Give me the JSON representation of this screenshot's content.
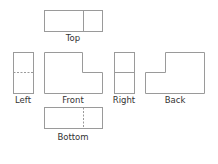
{
  "diagram": {
    "line_color": "#9a9a9a",
    "views": [
      {
        "id": "top",
        "label": "Top"
      },
      {
        "id": "left",
        "label": "Left"
      },
      {
        "id": "front",
        "label": "Front"
      },
      {
        "id": "right",
        "label": "Right"
      },
      {
        "id": "back",
        "label": "Back"
      },
      {
        "id": "bottom",
        "label": "Bottom"
      }
    ]
  }
}
